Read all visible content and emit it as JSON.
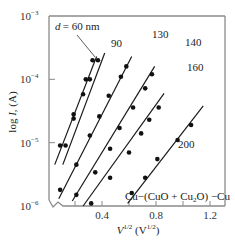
{
  "chart_data": {
    "type": "line",
    "title": "",
    "xlabel": "V^1/2 (V^1/2)",
    "ylabel": "log I, (A)",
    "xscale": "linear",
    "yscale": "log",
    "xlim": [
      0.0,
      1.3
    ],
    "ylim": [
      1e-06,
      0.001
    ],
    "x_ticks": [
      0.2,
      0.4,
      0.6,
      0.8,
      1.0,
      1.2
    ],
    "x_tick_labels": [
      "0.4",
      "0.8",
      "1.2"
    ],
    "x_tick_label_values": [
      0.4,
      0.8,
      1.2
    ],
    "y_tick_labels": [
      "10^-3",
      "10^-4",
      "10^-5",
      "10^-6"
    ],
    "y_tick_values": [
      0.001,
      0.0001,
      1e-05,
      1e-06
    ],
    "grid": false,
    "axis_break": "lower-left corner",
    "annotation": "Cu-(CuO + Cu2O) -Cu",
    "series_param": "d (nm)",
    "series": [
      {
        "name": "d = 60 nm",
        "label": "d = 60 nm",
        "line": [
          [
            0.05,
            4.5e-06
          ],
          [
            0.36,
            0.00023
          ]
        ],
        "points": [
          [
            0.09,
            9e-06
          ],
          [
            0.19,
            2.8e-05
          ],
          [
            0.28,
            0.0001
          ],
          [
            0.33,
            0.0002
          ]
        ]
      },
      {
        "name": "90",
        "label": "90",
        "line": [
          [
            0.11,
            4.5e-06
          ],
          [
            0.42,
            0.00026
          ]
        ],
        "points": [
          [
            0.13,
            9e-06
          ],
          [
            0.19,
            2.4e-05
          ],
          [
            0.26,
            5.8e-05
          ],
          [
            0.31,
            0.0001
          ],
          [
            0.37,
            0.0002
          ]
        ]
      },
      {
        "name": "130",
        "label": "130",
        "line": [
          [
            0.08,
            1.3e-06
          ],
          [
            0.62,
            0.00023
          ]
        ],
        "points": [
          [
            0.09,
            1.8e-06
          ],
          [
            0.21,
            4.5e-06
          ],
          [
            0.31,
            1.3e-05
          ],
          [
            0.38,
            2.6e-05
          ],
          [
            0.45,
            5.5e-05
          ],
          [
            0.54,
            0.00011
          ],
          [
            0.58,
            0.00016
          ]
        ]
      },
      {
        "name": "140",
        "label": "140",
        "line": [
          [
            0.18,
            1.2e-06
          ],
          [
            0.79,
            0.00016
          ]
        ],
        "points": [
          [
            0.21,
            1.5e-06
          ],
          [
            0.35,
            3.4e-06
          ],
          [
            0.46,
            8e-06
          ],
          [
            0.53,
            1.7e-05
          ],
          [
            0.63,
            3.6e-05
          ],
          [
            0.72,
            7.2e-05
          ],
          [
            0.77,
            0.00012
          ]
        ]
      },
      {
        "name": "160",
        "label": "160",
        "line": [
          [
            0.26,
            1e-06
          ],
          [
            0.86,
            6e-05
          ]
        ],
        "points": [
          [
            0.32,
            1.1e-06
          ],
          [
            0.46,
            2.8e-06
          ],
          [
            0.6,
            7e-06
          ],
          [
            0.69,
            1.4e-05
          ],
          [
            0.75,
            2.3e-05
          ],
          [
            0.82,
            3.6e-05
          ]
        ]
      },
      {
        "name": "200",
        "label": "200",
        "line": [
          [
            0.59,
            1.1e-06
          ],
          [
            1.15,
            3.8e-05
          ]
        ],
        "points": [
          [
            0.62,
            1.6e-06
          ],
          [
            0.72,
            2.8e-06
          ],
          [
            0.81,
            5.5e-06
          ],
          [
            0.96,
            1.1e-05
          ],
          [
            1.06,
            1.9e-05
          ]
        ]
      }
    ]
  },
  "labels": {
    "y_axis_title": "log I, (A)",
    "x_axis_title": "V^1/2 (V^1/2)",
    "annotation": "Cu−(CuO + Cu₂O) −Cu",
    "d_label": "d = 60 nm",
    "series_labels": [
      "90",
      "130",
      "140",
      "160",
      "200"
    ]
  }
}
